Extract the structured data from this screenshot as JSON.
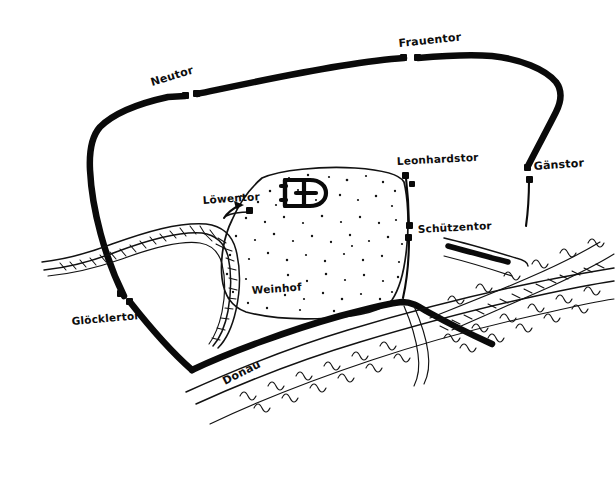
{
  "map": {
    "title": "Hand-drawn historical city plan",
    "background_color": "#ffffff",
    "ink_color": "#0a0a0a",
    "width": 615,
    "height": 490,
    "gates": [
      {
        "id": "neutor",
        "label": "Neutor",
        "label_x": 152,
        "label_y": 86,
        "rotation": -17,
        "marker_x": 185,
        "marker_y": 96,
        "marker2_x": 196,
        "marker2_y": 94
      },
      {
        "id": "frauentor",
        "label": "Frauentor",
        "label_x": 399,
        "label_y": 47,
        "rotation": -6,
        "marker_x": 404,
        "marker_y": 59,
        "marker2_x": 417,
        "marker2_y": 58
      },
      {
        "id": "gaenstor",
        "label": "Gänstor",
        "label_x": 534,
        "label_y": 170,
        "rotation": -4,
        "marker_x": 527,
        "marker_y": 168,
        "marker2_x": 530,
        "marker2_y": 178
      },
      {
        "id": "leonhardstor",
        "label": "Leonhardstor",
        "label_x": 397,
        "label_y": 165,
        "rotation": -3,
        "marker_x": 405,
        "marker_y": 175,
        "marker2_x": 412,
        "marker2_y": 183
      },
      {
        "id": "schuetzentor",
        "label": "Schützentor",
        "label_x": 418,
        "label_y": 233,
        "rotation": -3,
        "marker_x": 410,
        "marker_y": 227,
        "marker2_x": 409,
        "marker2_y": 237
      },
      {
        "id": "loewentor",
        "label": "Löwentor",
        "label_x": 203,
        "label_y": 204,
        "rotation": -4,
        "marker_x": 249,
        "marker_y": 211,
        "marker2_x": 239,
        "marker2_y": 204
      },
      {
        "id": "gloecklertor",
        "label": "Glöcklertor",
        "label_x": 72,
        "label_y": 325,
        "rotation": -5,
        "marker_x": 120,
        "marker_y": 294,
        "marker2_x": 129,
        "marker2_y": 302
      }
    ],
    "places": [
      {
        "id": "weinhof",
        "label": "Weinhof",
        "label_x": 252,
        "label_y": 294,
        "rotation": -4
      }
    ],
    "rivers": [
      {
        "id": "donau",
        "label": "Donau",
        "label_x": 225,
        "label_y": 385,
        "rotation": 27
      }
    ],
    "buildings": [
      {
        "id": "minster",
        "label": "",
        "x": 288,
        "y": 186
      }
    ]
  }
}
